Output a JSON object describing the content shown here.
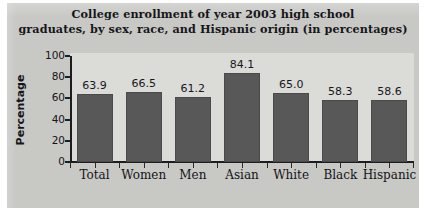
{
  "chart_data": {
    "type": "bar",
    "title": "College enrollment of year 2003 high school graduates, by sex, race, and Hispanic origin (in percentages)",
    "title_line1": "College enrollment of year 2003 high school",
    "title_line2": "graduates, by sex, race, and Hispanic origin (in percentages)",
    "xlabel": "",
    "ylabel": "Percentage",
    "ylim": [
      0,
      100
    ],
    "ytick_labels": [
      "0",
      "20",
      "40",
      "60",
      "80",
      "100"
    ],
    "ytick_values": [
      0,
      20,
      40,
      60,
      80,
      100
    ],
    "grid": false,
    "legend": false,
    "categories": [
      "Total",
      "Women",
      "Men",
      "Asian",
      "White",
      "Black",
      "Hispanic"
    ],
    "values": [
      63.9,
      66.5,
      61.2,
      84.1,
      65.0,
      58.3,
      58.6
    ],
    "value_labels": [
      "63.9",
      "66.5",
      "61.2",
      "84.1",
      "65.0",
      "58.3",
      "58.6"
    ],
    "bar_color": "#585859",
    "plot_background": "#dbdbd8",
    "figure_background": "#c8c8c5",
    "axis_color": "#1d1d20",
    "text_color": "#15151a"
  }
}
